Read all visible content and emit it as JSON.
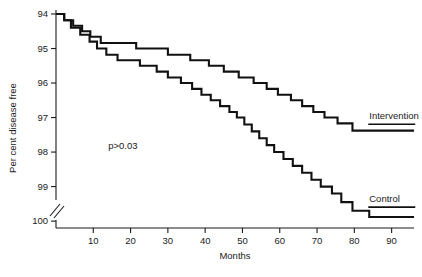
{
  "chart_data": {
    "type": "line",
    "subtype": "kaplan-meier-step",
    "title": "",
    "xlabel": "Months",
    "ylabel": "Per cent disease free",
    "xlim": [
      0,
      96
    ],
    "ylim": [
      93.8,
      100
    ],
    "xticks": [
      10,
      20,
      30,
      40,
      50,
      60,
      70,
      80,
      90
    ],
    "yticks": [
      94,
      95,
      96,
      97,
      98,
      99,
      100
    ],
    "grid": false,
    "legend_position": "inline-right-of-curve-end",
    "y_axis_break": true,
    "annotations": [
      {
        "text": "p>0.03",
        "x": 14,
        "y": 96.1
      }
    ],
    "series": [
      {
        "name": "Intervention",
        "label_x": 84,
        "label_y": 96.95,
        "points": [
          [
            0,
            100.0
          ],
          [
            2.2,
            100.0
          ],
          [
            2.2,
            99.82
          ],
          [
            4.6,
            99.82
          ],
          [
            4.6,
            99.66
          ],
          [
            7.0,
            99.66
          ],
          [
            7.0,
            99.5
          ],
          [
            9.2,
            99.5
          ],
          [
            9.2,
            99.34
          ],
          [
            12.0,
            99.34
          ],
          [
            12.0,
            99.16
          ],
          [
            21.5,
            99.16
          ],
          [
            21.5,
            99.0
          ],
          [
            30.0,
            99.0
          ],
          [
            30.0,
            98.82
          ],
          [
            36.0,
            98.82
          ],
          [
            36.0,
            98.66
          ],
          [
            41.0,
            98.66
          ],
          [
            41.0,
            98.5
          ],
          [
            45.0,
            98.5
          ],
          [
            45.0,
            98.33
          ],
          [
            49.0,
            98.33
          ],
          [
            49.0,
            98.16
          ],
          [
            53.0,
            98.16
          ],
          [
            53.0,
            98.0
          ],
          [
            56.5,
            98.0
          ],
          [
            56.5,
            97.83
          ],
          [
            59.5,
            97.83
          ],
          [
            59.5,
            97.66
          ],
          [
            63.0,
            97.66
          ],
          [
            63.0,
            97.5
          ],
          [
            66.0,
            97.5
          ],
          [
            66.0,
            97.33
          ],
          [
            69.0,
            97.33
          ],
          [
            69.0,
            97.16
          ],
          [
            72.0,
            97.16
          ],
          [
            72.0,
            97.0
          ],
          [
            75.5,
            97.0
          ],
          [
            75.5,
            96.83
          ],
          [
            79.5,
            96.83
          ],
          [
            79.5,
            96.62
          ],
          [
            96.0,
            96.62
          ]
        ]
      },
      {
        "name": "Control",
        "label_x": 84,
        "label_y": 94.55,
        "points": [
          [
            0,
            100.0
          ],
          [
            2.2,
            100.0
          ],
          [
            2.2,
            99.82
          ],
          [
            4.0,
            99.82
          ],
          [
            4.0,
            99.6
          ],
          [
            6.5,
            99.6
          ],
          [
            6.5,
            99.4
          ],
          [
            9.0,
            99.4
          ],
          [
            9.0,
            99.2
          ],
          [
            11.0,
            99.2
          ],
          [
            11.0,
            99.0
          ],
          [
            13.5,
            99.0
          ],
          [
            13.5,
            98.82
          ],
          [
            16.5,
            98.82
          ],
          [
            16.5,
            98.66
          ],
          [
            22.5,
            98.66
          ],
          [
            22.5,
            98.5
          ],
          [
            27.0,
            98.5
          ],
          [
            27.0,
            98.33
          ],
          [
            30.0,
            98.33
          ],
          [
            30.0,
            98.16
          ],
          [
            33.5,
            98.16
          ],
          [
            33.5,
            98.0
          ],
          [
            36.5,
            98.0
          ],
          [
            36.5,
            97.83
          ],
          [
            39.0,
            97.83
          ],
          [
            39.0,
            97.66
          ],
          [
            41.5,
            97.66
          ],
          [
            41.5,
            97.5
          ],
          [
            44.0,
            97.5
          ],
          [
            44.0,
            97.33
          ],
          [
            46.5,
            97.33
          ],
          [
            46.5,
            97.16
          ],
          [
            48.5,
            97.16
          ],
          [
            48.5,
            97.0
          ],
          [
            50.5,
            97.0
          ],
          [
            50.5,
            96.8
          ],
          [
            52.5,
            96.8
          ],
          [
            52.5,
            96.6
          ],
          [
            54.5,
            96.6
          ],
          [
            54.5,
            96.4
          ],
          [
            56.5,
            96.4
          ],
          [
            56.5,
            96.2
          ],
          [
            58.5,
            96.2
          ],
          [
            58.5,
            96.0
          ],
          [
            61.0,
            96.0
          ],
          [
            61.0,
            95.8
          ],
          [
            63.5,
            95.8
          ],
          [
            63.5,
            95.6
          ],
          [
            66.0,
            95.6
          ],
          [
            66.0,
            95.4
          ],
          [
            68.5,
            95.4
          ],
          [
            68.5,
            95.2
          ],
          [
            71.0,
            95.2
          ],
          [
            71.0,
            95.0
          ],
          [
            74.0,
            95.0
          ],
          [
            74.0,
            94.8
          ],
          [
            76.5,
            94.8
          ],
          [
            76.5,
            94.55
          ],
          [
            79.5,
            94.55
          ],
          [
            79.5,
            94.3
          ],
          [
            84.0,
            94.3
          ],
          [
            84.0,
            94.12
          ],
          [
            96.0,
            94.12
          ]
        ]
      }
    ]
  },
  "labels": {
    "ylabel": "Per cent disease free",
    "xlabel": "Months",
    "pvalue": "p>0.03",
    "series_intervention": "Intervention",
    "series_control": "Control",
    "yticks": [
      "100",
      "99",
      "98",
      "97",
      "96",
      "95",
      "94"
    ],
    "xticks": [
      "10",
      "20",
      "30",
      "40",
      "50",
      "60",
      "70",
      "80",
      "90"
    ]
  }
}
